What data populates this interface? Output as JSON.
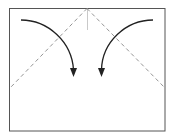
{
  "diagram": {
    "type": "origami-fold-step",
    "colors": {
      "outline": "#555555",
      "fold_line": "#888888",
      "crease": "#bbbbbb",
      "arrow": "#222222",
      "background": "#ffffff"
    },
    "paper": {
      "x": 9,
      "y": 8,
      "width": 156,
      "height": 123
    },
    "fold_lines": [
      {
        "name": "left-valley-fold",
        "from": [
          87,
          8
        ],
        "to": [
          10,
          88
        ]
      },
      {
        "name": "right-valley-fold",
        "from": [
          87,
          8
        ],
        "to": [
          165,
          88
        ]
      }
    ],
    "center_crease": {
      "from": [
        87,
        8
      ],
      "to": [
        87,
        30
      ]
    },
    "arrows": [
      {
        "name": "left-fold-arrow",
        "direction": "down-right"
      },
      {
        "name": "right-fold-arrow",
        "direction": "down-left"
      }
    ]
  }
}
